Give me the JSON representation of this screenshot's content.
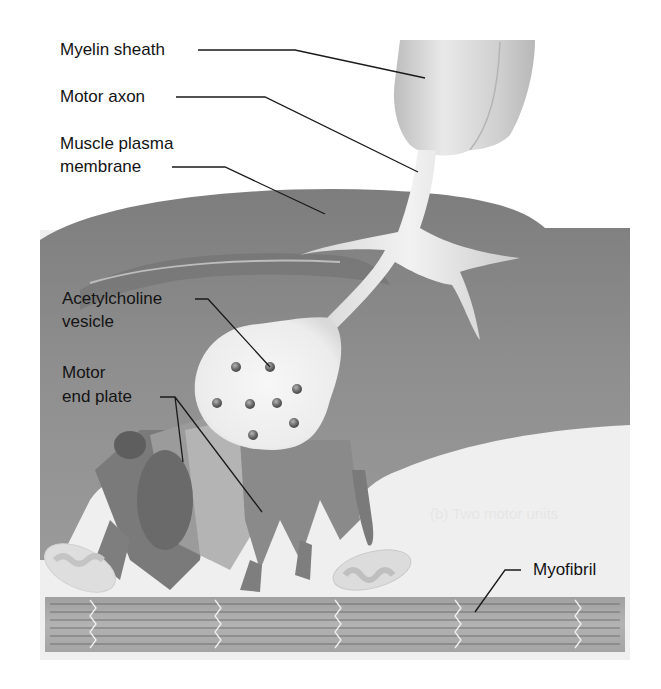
{
  "figure": {
    "type": "anatomical-illustration",
    "palette": {
      "background": "#ffffff",
      "muscle_fiber": "#8c8c8c",
      "muscle_fiber_dark": "#6f6f6f",
      "axon": "#e4e4e4",
      "terminal": "#f0f0f0",
      "vesicle": "#7a7a7a",
      "sarcoplasm": "#efefef",
      "myofibril": "#a9a9a9",
      "leader_line": "#1a1a1a"
    },
    "vesicle_count": 8,
    "background_bleed_text": "(b) Two motor units"
  },
  "labels": {
    "myelin_sheath": "Myelin sheath",
    "motor_axon": "Motor axon",
    "muscle_plasma_membrane_line1": "Muscle plasma",
    "muscle_plasma_membrane_line2": "membrane",
    "acetylcholine_vesicle_line1": "Acetylcholine",
    "acetylcholine_vesicle_line2": "vesicle",
    "motor_end_plate_line1": "Motor",
    "motor_end_plate_line2": "end plate",
    "myofibril": "Myofibril"
  }
}
